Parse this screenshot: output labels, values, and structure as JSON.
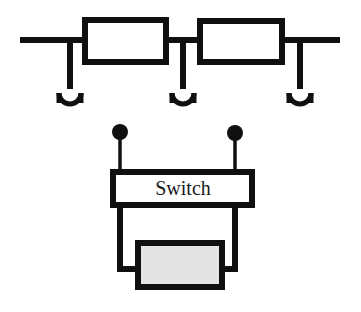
{
  "diagram": {
    "canvas": {
      "width": 361,
      "height": 312,
      "background": "#ffffff"
    },
    "colors": {
      "line": "#101010",
      "box_fill": "#ffffff",
      "gray_fill": "#e4e4e4",
      "text": "#1a1a1a"
    },
    "upper_section": {
      "name": "antenna-feed-line",
      "bus": {
        "x1": 20,
        "y1": 40,
        "x2": 340,
        "y2": 40,
        "stroke_width": 6
      },
      "components": [
        {
          "name": "component-box-left",
          "label": "",
          "x": 85,
          "y": 20,
          "width": 81,
          "height": 42
        },
        {
          "name": "component-box-right",
          "label": "",
          "x": 200,
          "y": 21,
          "width": 82,
          "height": 41
        }
      ],
      "drops": [
        {
          "name": "antenna-drop-left",
          "x": 70,
          "y1": 40,
          "y2": 88
        },
        {
          "name": "antenna-drop-middle",
          "x": 183,
          "y1": 40,
          "y2": 88
        },
        {
          "name": "antenna-drop-right",
          "x": 300,
          "y1": 40,
          "y2": 88
        }
      ],
      "forks": [
        {
          "name": "antenna-fork-left",
          "cx": 70,
          "cy": 92,
          "radius": 11,
          "leg_bottom": 103
        },
        {
          "name": "antenna-fork-middle",
          "cx": 183,
          "cy": 92,
          "radius": 11,
          "leg_bottom": 103
        },
        {
          "name": "antenna-fork-right",
          "cx": 300,
          "cy": 92,
          "radius": 11,
          "leg_bottom": 103
        }
      ]
    },
    "lower_section": {
      "name": "switch-assembly",
      "terminals": [
        {
          "name": "terminal-dot-left",
          "cx": 120,
          "cy": 132,
          "radius": 8,
          "lead_y2": 172
        },
        {
          "name": "terminal-dot-right",
          "cx": 235,
          "cy": 133,
          "radius": 8,
          "lead_y2": 172
        }
      ],
      "switch_box": {
        "name": "switch-box",
        "label": "Switch",
        "x": 113,
        "y": 172,
        "width": 139,
        "height": 33,
        "label_x": 183,
        "label_y": 190
      },
      "legs": [
        {
          "name": "switch-leg-left",
          "x": 120,
          "y1": 205,
          "y2": 272
        },
        {
          "name": "switch-leg-right",
          "x": 235,
          "y1": 205,
          "y2": 272
        }
      ],
      "load_box": {
        "name": "load-box",
        "label": "",
        "x": 138,
        "y": 243,
        "width": 84,
        "height": 44,
        "fill": "#e4e4e4"
      }
    }
  }
}
